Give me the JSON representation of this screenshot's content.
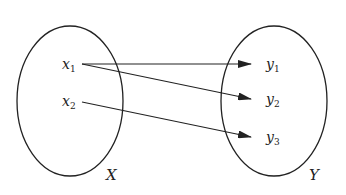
{
  "diagram": {
    "type": "function-mapping",
    "colors": {
      "stroke": "#222222",
      "background": "#ffffff"
    },
    "sets": [
      {
        "id": "X",
        "label": "X",
        "elements": [
          {
            "id": "x1",
            "base": "x",
            "sub": "1"
          },
          {
            "id": "x2",
            "base": "x",
            "sub": "2"
          }
        ]
      },
      {
        "id": "Y",
        "label": "Y",
        "elements": [
          {
            "id": "y1",
            "base": "y",
            "sub": "1"
          },
          {
            "id": "y2",
            "base": "y",
            "sub": "2"
          },
          {
            "id": "y3",
            "base": "y",
            "sub": "3"
          }
        ]
      }
    ],
    "arrows": [
      {
        "from": "x1",
        "to": "y1"
      },
      {
        "from": "x1",
        "to": "y2"
      },
      {
        "from": "x2",
        "to": "y3"
      }
    ]
  }
}
